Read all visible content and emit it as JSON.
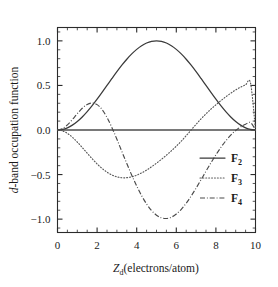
{
  "figure": {
    "background_color": "#ffffff",
    "axis_color": "#2b2b2b"
  },
  "chart_data": {
    "type": "line",
    "title": "",
    "xlabel": "Z_d(electrons/atom)",
    "xlabel_main": "Z",
    "xlabel_sub": "d",
    "xlabel_rest": "(electrons/atom)",
    "ylabel": "d-band occupation function",
    "ylabel_italic_part": "d",
    "ylabel_rest": "-band occupation function",
    "xlim": [
      0,
      10
    ],
    "ylim": [
      -1.15,
      1.15
    ],
    "xticks": [
      0,
      2,
      4,
      6,
      8,
      10
    ],
    "xtick_labels": [
      "0",
      "2",
      "4",
      "6",
      "8",
      "10"
    ],
    "yticks": [
      1.0,
      0.5,
      0.0,
      -0.5,
      -1.0
    ],
    "ytick_labels": [
      "1.0",
      "0.5",
      "0.0",
      "−0.5",
      "−1.0"
    ],
    "x_minor_interval": 0.5,
    "y_minor_interval": 0.1,
    "grid": false,
    "legend_position": "center-right",
    "zero_line": true,
    "series": [
      {
        "name": "F2",
        "label": "F",
        "subscript": "2",
        "style": "solid",
        "color": "#3a3a3a",
        "description": "single positive lobe peaking at 1.0 near Zd = 5",
        "x": [
          0,
          0.25,
          0.5,
          0.75,
          1.0,
          1.25,
          1.5,
          1.75,
          2.0,
          2.25,
          2.5,
          2.75,
          3.0,
          3.25,
          3.5,
          3.75,
          4.0,
          4.25,
          4.5,
          4.75,
          5.0,
          5.25,
          5.5,
          5.75,
          6.0,
          6.25,
          6.5,
          6.75,
          7.0,
          7.25,
          7.5,
          7.75,
          8.0,
          8.25,
          8.5,
          8.75,
          9.0,
          9.25,
          9.5,
          9.75,
          10.0
        ],
        "y": [
          0.0,
          0.0062,
          0.0245,
          0.0545,
          0.0955,
          0.1464,
          0.2061,
          0.273,
          0.3455,
          0.4218,
          0.5,
          0.5782,
          0.6545,
          0.727,
          0.7939,
          0.8536,
          0.9045,
          0.9455,
          0.9755,
          0.9938,
          1.0,
          0.9938,
          0.9755,
          0.9455,
          0.9045,
          0.8536,
          0.7939,
          0.727,
          0.6545,
          0.5782,
          0.5,
          0.4218,
          0.3455,
          0.273,
          0.2061,
          0.1464,
          0.0955,
          0.0545,
          0.0245,
          0.0062,
          0.0
        ]
      },
      {
        "name": "F3",
        "label": "F",
        "subscript": "3",
        "style": "dotted",
        "color": "#585858",
        "description": "negative lobe min -0.65 near Zd = 3.3, crosses zero at 5, positive lobe max 0.65 near Zd = 6.7",
        "x": [
          0,
          0.25,
          0.5,
          0.75,
          1.0,
          1.25,
          1.5,
          1.75,
          2.0,
          2.25,
          2.5,
          2.75,
          3.0,
          3.25,
          3.5,
          3.75,
          4.0,
          4.25,
          4.5,
          4.75,
          5.0,
          5.25,
          5.5,
          5.75,
          6.0,
          6.25,
          6.5,
          6.75,
          7.0,
          7.25,
          7.5,
          7.75,
          8.0,
          8.25,
          8.5,
          8.75,
          9.0,
          9.25,
          9.5,
          9.75,
          10.0
        ],
        "y": [
          0.0,
          -0.0098,
          -0.0378,
          -0.081,
          -0.1353,
          -0.1964,
          -0.2601,
          -0.3225,
          -0.3804,
          -0.4312,
          -0.4729,
          -0.5045,
          -0.5253,
          -0.5353,
          -0.535,
          -0.5251,
          -0.5067,
          -0.481,
          -0.4493,
          -0.4127,
          -0.3724,
          -0.329,
          -0.2829,
          -0.2339,
          -0.1816,
          -0.1252,
          -0.0641,
          0.0,
          0.0641,
          0.1252,
          0.1816,
          0.2339,
          0.2829,
          0.329,
          0.3724,
          0.4127,
          0.4493,
          0.481,
          0.5067,
          0.5251,
          0.0
        ]
      },
      {
        "name": "F4",
        "label": "F",
        "subscript": "4",
        "style": "dash-dot",
        "color": "#4a4a4a",
        "description": "positive lobe 0.25 near Zd = 2.5, deep negative minimum -1.0 at Zd = 5, positive lobe 0.25 near Zd = 7.5",
        "x": [
          0,
          0.25,
          0.5,
          0.75,
          1.0,
          1.25,
          1.5,
          1.75,
          2.0,
          2.25,
          2.5,
          2.75,
          3.0,
          3.25,
          3.5,
          3.75,
          4.0,
          4.25,
          4.5,
          4.75,
          5.0,
          5.25,
          5.5,
          5.75,
          6.0,
          6.25,
          6.5,
          6.75,
          7.0,
          7.25,
          7.5,
          7.75,
          8.0,
          8.25,
          8.5,
          8.75,
          9.0,
          9.25,
          9.5,
          9.75,
          10.0
        ],
        "y": [
          0.0,
          0.0155,
          0.0574,
          0.1169,
          0.183,
          0.2436,
          0.2869,
          0.3028,
          0.2845,
          0.2297,
          0.1411,
          0.0259,
          -0.1036,
          -0.2418,
          -0.3764,
          -0.5066,
          -0.6283,
          -0.7373,
          -0.8301,
          -0.9036,
          -0.9558,
          -0.9856,
          -0.9928,
          -0.9781,
          -0.943,
          -0.8899,
          -0.8215,
          -0.7411,
          -0.6521,
          -0.558,
          -0.4623,
          -0.3681,
          -0.2784,
          -0.1955,
          -0.1215,
          -0.0577,
          -0.0053,
          0.0355,
          0.0648,
          0.0835,
          0.0
        ]
      }
    ]
  },
  "legend": {
    "entries": [
      {
        "label": "F",
        "subscript": "2",
        "style": "solid"
      },
      {
        "label": "F",
        "subscript": "3",
        "style": "dotted"
      },
      {
        "label": "F",
        "subscript": "4",
        "style": "dash-dot"
      }
    ]
  }
}
